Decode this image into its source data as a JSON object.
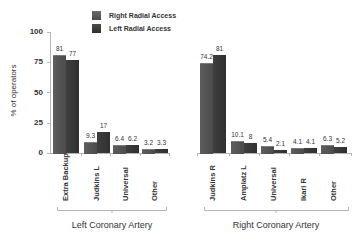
{
  "chart_data": {
    "type": "bar",
    "title": "",
    "ylabel": "% of operators",
    "xlabel": "",
    "ylim": [
      0,
      100
    ],
    "yticks": [
      0,
      25,
      50,
      75,
      100
    ],
    "grid": false,
    "legend_position": "top",
    "legend": [
      "Right Radial Access",
      "Left Radial Access"
    ],
    "groups": [
      {
        "name": "Left Coronary Artery",
        "categories": [
          "Extra Backup",
          "Judkins L",
          "Universal",
          "Other"
        ],
        "series": [
          {
            "name": "Right Radial Access",
            "values": [
              81,
              9.3,
              6.4,
              3.2
            ]
          },
          {
            "name": "Left Radial Access",
            "values": [
              77,
              17,
              6.2,
              3.3
            ]
          }
        ]
      },
      {
        "name": "Right Coronary Artery",
        "categories": [
          "Judkins R",
          "Amplatz L",
          "Universal",
          "Ikari R",
          "Other"
        ],
        "series": [
          {
            "name": "Right Radial Access",
            "values": [
              74.2,
              10.1,
              5.4,
              4.1,
              6.3
            ]
          },
          {
            "name": "Left Radial Access",
            "values": [
              81,
              8,
              2.1,
              4.1,
              5.2
            ]
          }
        ]
      }
    ]
  },
  "labels": {
    "ylabel": "% of operators",
    "legend_right": "Right Radial Access",
    "legend_left": "Left Radial Access",
    "group_left": "Left Coronary Artery",
    "group_right": "Right Coronary Artery",
    "yticks": [
      "0",
      "25",
      "50",
      "75",
      "100"
    ]
  },
  "colors": {
    "right_radial": "#555555",
    "left_radial": "#3c3c3c",
    "axis": "#b5b5b5"
  }
}
